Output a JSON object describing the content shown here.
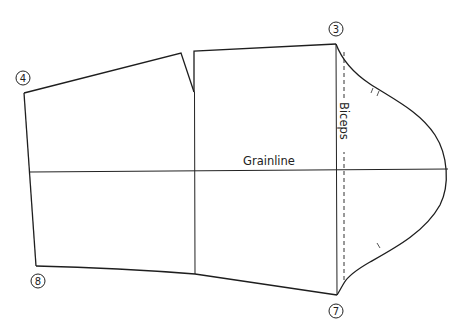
{
  "diagram": {
    "type": "sewing-pattern-sleeve",
    "labels": {
      "grainline": "Grainline",
      "biceps": "Biceps"
    },
    "points": [
      {
        "id": "3",
        "label": "3"
      },
      {
        "id": "4",
        "label": "4"
      },
      {
        "id": "7",
        "label": "7"
      },
      {
        "id": "8",
        "label": "8"
      }
    ],
    "notches": {
      "front": "single",
      "back": "double"
    },
    "colors": {
      "line": "#1e1e1e",
      "background": "#ffffff"
    }
  }
}
